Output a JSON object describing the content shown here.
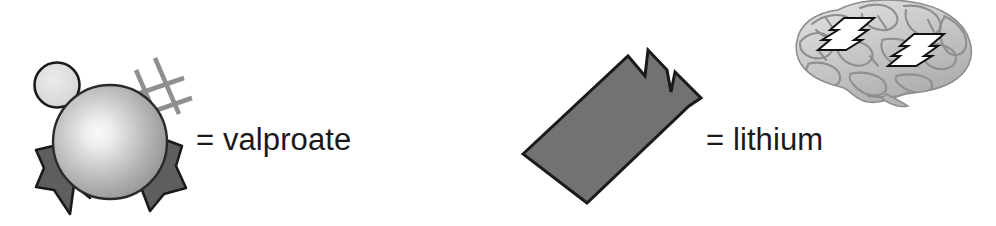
{
  "figure": {
    "type": "legend-key",
    "background_color": "#ffffff",
    "width": 996,
    "height": 226
  },
  "legend": {
    "entries": [
      {
        "id": "valproate",
        "symbol_name": "sphere-with-grid-and-ribbons",
        "equals_sign": "=",
        "label": "= valproate",
        "drug": "valproate",
        "symbol_colors": {
          "sphere_highlight": "#f2f2f2",
          "sphere_mid": "#b4b4b4",
          "sphere_edge": "#8a8a8a",
          "small_circle": "#d8d8d8",
          "ribbon": "#5e5e5e",
          "grid_lines": "#8f8f8f",
          "outline": "#1a1a1a"
        }
      },
      {
        "id": "lithium",
        "symbol_name": "jagged-edged-slab",
        "equals_sign": "=",
        "label": "= lithium",
        "drug": "lithium",
        "symbol_colors": {
          "fill": "#727272",
          "outline": "#1a1a1a"
        }
      }
    ]
  },
  "illustration": {
    "name": "brain-with-lightning-bolts",
    "description": "lateral view of human brain",
    "colors": {
      "brain_light": "#e3e3e3",
      "brain_mid": "#bdbdbd",
      "brain_dark": "#9a9a9a",
      "sulci": "#8d8d8d",
      "bolt_fill": "#ffffff",
      "bolt_outline": "#111111"
    },
    "bolt_count": 2
  },
  "text_color": "#1a1a1a"
}
